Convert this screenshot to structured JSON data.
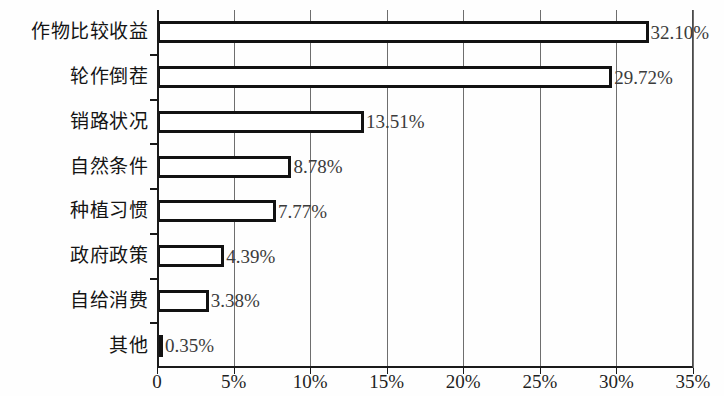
{
  "chart_data": {
    "type": "bar",
    "orientation": "horizontal",
    "title": "",
    "subtitle": "",
    "xlabel": "",
    "ylabel": "",
    "categories": [
      "作物比较收益",
      "轮作倒茬",
      "销路状况",
      "自然条件",
      "种植习惯",
      "政府政策",
      "自给消费",
      "其他"
    ],
    "values": [
      32.1,
      29.72,
      13.51,
      8.78,
      7.77,
      4.39,
      3.38,
      0.35
    ],
    "value_labels": [
      "32.10%",
      "29.72%",
      "13.51%",
      "8.78%",
      "7.77%",
      "4.39%",
      "3.38%",
      "0.35%"
    ],
    "xlim": [
      0,
      35
    ],
    "xticks": [
      0,
      5,
      10,
      15,
      20,
      25,
      30,
      35
    ],
    "xtick_labels": [
      "0",
      "5%",
      "10%",
      "15%",
      "20%",
      "25%",
      "30%",
      "35%"
    ],
    "grid": true,
    "legend": null,
    "colors": {
      "bar_fill": "#ffffff",
      "bar_border": "#121212",
      "gridline": "#6e6e6e",
      "axis": "#1a1a1a",
      "value_text": "#3b3b3b",
      "category_text": "#141414",
      "background": "#fefefe"
    }
  }
}
